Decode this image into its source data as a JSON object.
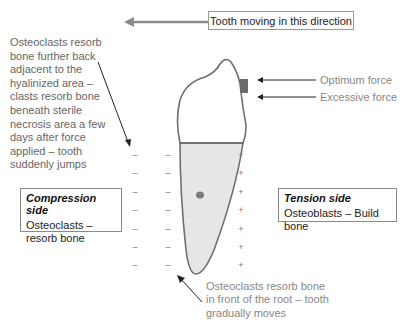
{
  "direction_label": "Tooth moving in this direction",
  "left_note": "Osteoclasts resorb bone further back adjacent to the hyalinized area – clasts resorb bone beneath sterile necrosis area a few days after force applied – tooth suddenly jumps",
  "forces": {
    "optimum": "Optimum force",
    "excessive": "Excessive force"
  },
  "compression": {
    "title": "Compression side",
    "body": "Osteoclasts – resorb bone"
  },
  "tension": {
    "title": "Tension side",
    "body": "Osteoblasts – Build bone"
  },
  "bottom_note": "Osteoclasts resorb bone in front of the root – tooth gradually moves",
  "signs": {
    "minus": "–",
    "plus": "+"
  },
  "colors": {
    "outline": "#6e6e6e",
    "root_fill": "#e4e4e4",
    "bracket": "#6a6a6a",
    "arrow": "#222222",
    "direction_arrow": "#8a8a8a"
  }
}
